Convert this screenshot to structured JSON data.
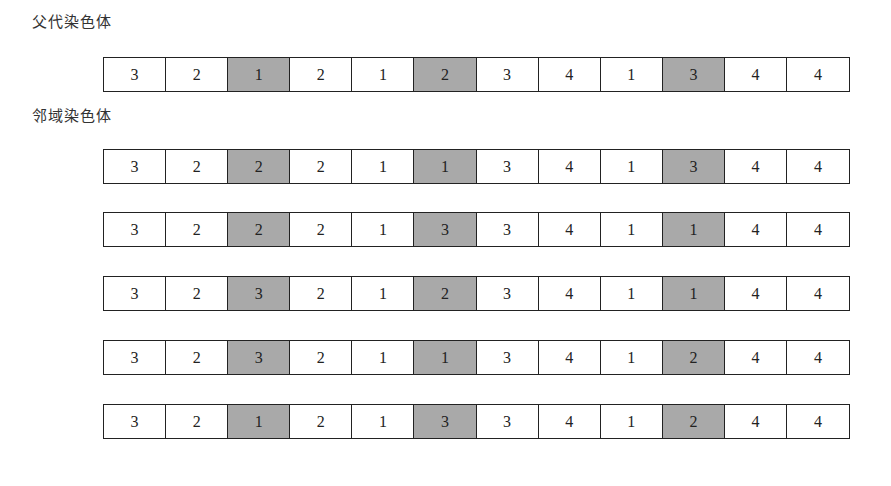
{
  "parent_label": "父代染色体",
  "neighbor_label": "邻域染色体",
  "highlight_color": "#a9a9a9",
  "highlight_indices": [
    2,
    5,
    9
  ],
  "parent": [
    3,
    2,
    1,
    2,
    1,
    2,
    3,
    4,
    1,
    3,
    4,
    4
  ],
  "neighbors": [
    [
      3,
      2,
      2,
      2,
      1,
      1,
      3,
      4,
      1,
      3,
      4,
      4
    ],
    [
      3,
      2,
      2,
      2,
      1,
      3,
      3,
      4,
      1,
      1,
      4,
      4
    ],
    [
      3,
      2,
      3,
      2,
      1,
      2,
      3,
      4,
      1,
      1,
      4,
      4
    ],
    [
      3,
      2,
      3,
      2,
      1,
      1,
      3,
      4,
      1,
      2,
      4,
      4
    ],
    [
      3,
      2,
      1,
      2,
      1,
      3,
      3,
      4,
      1,
      2,
      4,
      4
    ]
  ]
}
